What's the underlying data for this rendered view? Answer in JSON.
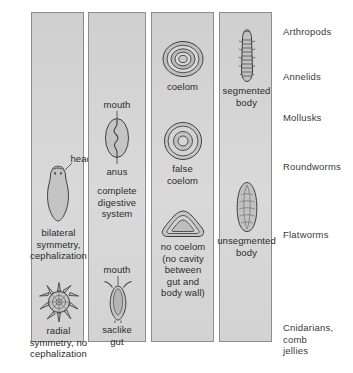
{
  "diagram": {
    "panel_bg": "#c9c9c9",
    "border_color": "#8d8d8d",
    "text_color": "#2b2b2b"
  },
  "columns": [
    {
      "id": "symmetry",
      "figures": [
        {
          "name": "planarian-bilateral",
          "icon": "bilateral-organism-icon",
          "pointer_label": "head",
          "caption": "bilateral\nsymmetry,\ncephalization"
        },
        {
          "name": "radial-organism",
          "icon": "radial-organism-icon",
          "pointer_label": "",
          "caption": "radial\nsymmetry, no\ncephalization"
        }
      ]
    },
    {
      "id": "digestion",
      "figures": [
        {
          "name": "complete-gut",
          "icon": "complete-digestive-tract-icon",
          "label_top": "mouth",
          "label_bottom": "anus",
          "caption": "complete\ndigestive\nsystem"
        },
        {
          "name": "saclike-gut",
          "icon": "saclike-gut-icon",
          "label_top": "mouth",
          "label_bottom": "",
          "caption": "saclike\ngut"
        }
      ]
    },
    {
      "id": "coelom",
      "figures": [
        {
          "name": "true-coelom",
          "icon": "coelom-cross-section-icon",
          "caption": "coelom"
        },
        {
          "name": "false-coelom",
          "icon": "pseudocoelom-cross-section-icon",
          "caption": "false\ncoelom"
        },
        {
          "name": "acoelomate",
          "icon": "acoelomate-cross-section-icon",
          "caption": "no coelom\n(no cavity\nbetween\ngut and\nbody wall)"
        }
      ]
    },
    {
      "id": "segmentation",
      "figures": [
        {
          "name": "segmented-worm",
          "icon": "segmented-body-icon",
          "caption": "segmented\nbody"
        },
        {
          "name": "unsegmented-worm",
          "icon": "unsegmented-body-icon",
          "caption": "unsegmented\nbody"
        }
      ]
    }
  ],
  "group_labels": [
    {
      "name": "arthropods",
      "text": "Arthropods"
    },
    {
      "name": "annelids",
      "text": "Annelids"
    },
    {
      "name": "mollusks",
      "text": "Mollusks"
    },
    {
      "name": "roundworms",
      "text": "Roundworms"
    },
    {
      "name": "flatworms",
      "text": "Flatworms"
    },
    {
      "name": "cnidarians",
      "text": "Cnidarians,\ncomb\njellies"
    }
  ]
}
